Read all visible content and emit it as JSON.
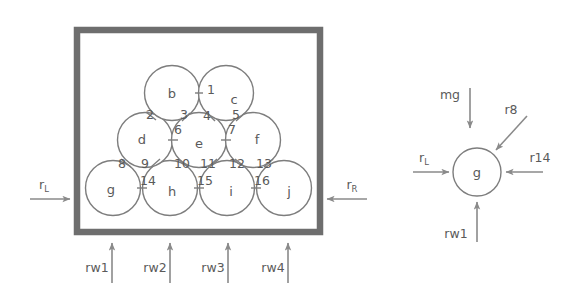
{
  "figure": {
    "title": "",
    "left_diagram": {
      "name": "packed-disks-in-container",
      "container": {
        "label": "rigid-box",
        "left_wall": true,
        "right_wall": true,
        "bottom_wall": true,
        "top_wall": true
      },
      "bodies": [
        {
          "id": "b",
          "label": "b",
          "cx": 172,
          "cy": 93,
          "r": 27.5,
          "row": "top"
        },
        {
          "id": "c",
          "label": "c",
          "cx": 226,
          "cy": 93,
          "r": 27.5,
          "row": "top"
        },
        {
          "id": "d",
          "label": "d",
          "cx": 145,
          "cy": 140,
          "r": 27.5,
          "row": "middle"
        },
        {
          "id": "e",
          "label": "e",
          "cx": 199,
          "cy": 140,
          "r": 27.5,
          "row": "middle"
        },
        {
          "id": "f",
          "label": "f",
          "cx": 253,
          "cy": 140,
          "r": 27.5,
          "row": "middle"
        },
        {
          "id": "g",
          "label": "g",
          "cx": 113,
          "cy": 188,
          "r": 27.5,
          "row": "bottom"
        },
        {
          "id": "h",
          "label": "h",
          "cx": 170,
          "cy": 188,
          "r": 27.5,
          "row": "bottom"
        },
        {
          "id": "i",
          "label": "i",
          "cx": 227,
          "cy": 188,
          "r": 27.5,
          "row": "bottom"
        },
        {
          "id": "j",
          "label": "j",
          "cx": 284,
          "cy": 188,
          "r": 27.5,
          "row": "bottom"
        }
      ],
      "contacts": [
        {
          "n": "1",
          "x": 213,
          "y": 93,
          "tx": 211,
          "ty": 94
        },
        {
          "n": "2",
          "x": 154,
          "y": 115,
          "tx": 150,
          "ty": 119
        },
        {
          "n": "3",
          "x": 186,
          "y": 116,
          "tx": 184,
          "ty": 119
        },
        {
          "n": "4",
          "x": 211,
          "y": 116,
          "tx": 207,
          "ty": 120
        },
        {
          "n": "5",
          "x": 240,
          "y": 116,
          "tx": 236,
          "ty": 119
        },
        {
          "n": "6",
          "x": 180,
          "y": 129,
          "tx": 177,
          "ty": 133
        },
        {
          "n": "7",
          "x": 234,
          "y": 129,
          "tx": 232,
          "ty": 133
        },
        {
          "n": "8",
          "x": 128,
          "y": 163,
          "tx": 122,
          "ty": 167
        },
        {
          "n": "9",
          "x": 155,
          "y": 163,
          "tx": 145,
          "ty": 167
        },
        {
          "n": "10",
          "x": 185,
          "y": 163,
          "tx": 180,
          "ty": 167
        },
        {
          "n": "11",
          "x": 212,
          "y": 163,
          "tx": 206,
          "ty": 167
        },
        {
          "n": "12",
          "x": 240,
          "y": 163,
          "tx": 234,
          "ty": 167
        },
        {
          "n": "13",
          "x": 268,
          "y": 163,
          "tx": 261,
          "ty": 167
        },
        {
          "n": "14",
          "x": 142,
          "y": 188,
          "tx": 146,
          "ty": 183
        },
        {
          "n": "15",
          "x": 199,
          "y": 188,
          "tx": 203,
          "ty": 183
        },
        {
          "n": "16",
          "x": 256,
          "y": 188,
          "tx": 260,
          "ty": 183
        }
      ],
      "wall_reactions": [
        {
          "id": "rL",
          "label": "r",
          "subscript": "L",
          "direction": "right",
          "label_x": 44,
          "label_y": 178
        },
        {
          "id": "rR",
          "label": "r",
          "subscript": "R",
          "direction": "left",
          "label_x": 345,
          "label_y": 178
        },
        {
          "id": "rw1",
          "label": "rw1",
          "direction": "up",
          "label_x": 100,
          "label_y": 273
        },
        {
          "id": "rw2",
          "label": "rw2",
          "direction": "up",
          "label_x": 158,
          "label_y": 273
        },
        {
          "id": "rw3",
          "label": "rw3",
          "direction": "up",
          "label_x": 216,
          "label_y": 273
        },
        {
          "id": "rw4",
          "label": "rw4",
          "direction": "up",
          "label_x": 276,
          "label_y": 273
        }
      ]
    },
    "right_diagram": {
      "name": "free-body-diagram-of-disk-g",
      "body": {
        "id": "g",
        "label": "g",
        "cx": 477,
        "cy": 172,
        "r": 24
      },
      "forces": [
        {
          "id": "mg",
          "label": "mg",
          "direction": "down",
          "label_x": 444,
          "label_y": 98
        },
        {
          "id": "r8",
          "label": "r8",
          "direction": "down-left",
          "label_x": 510,
          "label_y": 110
        },
        {
          "id": "rL",
          "label": "r",
          "subscript": "L",
          "direction": "right",
          "label_x": 419,
          "label_y": 160
        },
        {
          "id": "r14",
          "label": "r14",
          "direction": "left",
          "label_x": 545,
          "label_y": 160
        },
        {
          "id": "rw1",
          "label": "rw1",
          "direction": "up",
          "label_x": 443,
          "label_y": 239
        }
      ]
    },
    "colors": {
      "stroke": "#7d7d7d",
      "wall": "#6e6e6e",
      "arrow": "#8a8a8a",
      "text": "#5a5a5a",
      "background": "#ffffff"
    }
  }
}
